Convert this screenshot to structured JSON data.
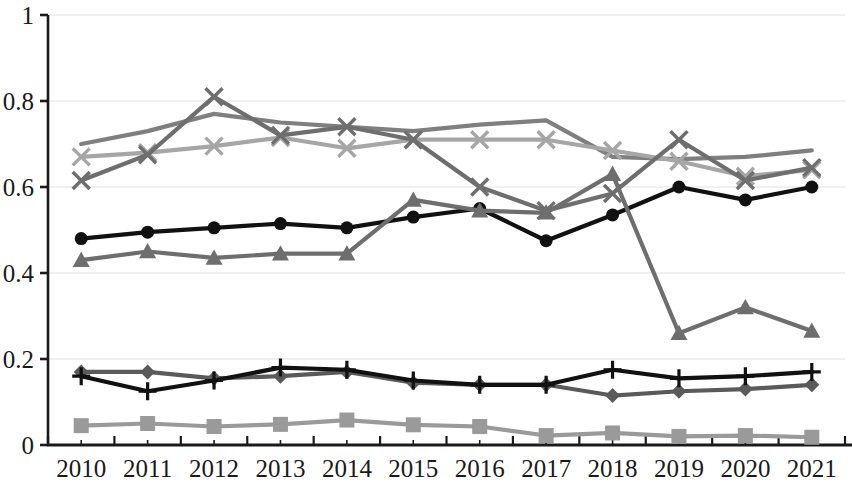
{
  "chart_data": {
    "type": "line",
    "title": "",
    "subtitle": "",
    "xlabel": "",
    "ylabel": "",
    "xlim": [
      2010,
      2021
    ],
    "ylim": [
      0,
      1
    ],
    "grid": true,
    "legend_position": "none",
    "categories": [
      "2010",
      "2011",
      "2012",
      "2013",
      "2014",
      "2015",
      "2016",
      "2017",
      "2018",
      "2019",
      "2020",
      "2021"
    ],
    "ytick_labels": [
      "0",
      "0.2",
      "0.4",
      "0.6",
      "0.8",
      "1"
    ],
    "ytick_values": [
      0,
      0.2,
      0.4,
      0.6,
      0.8,
      1
    ],
    "series": [
      {
        "name": "series-no-marker-upper",
        "marker": "none",
        "color": "#7f7f7f",
        "values": [
          0.7,
          0.73,
          0.77,
          0.75,
          0.74,
          0.73,
          0.745,
          0.755,
          0.67,
          0.665,
          0.67,
          0.685
        ]
      },
      {
        "name": "series-x-light",
        "marker": "x",
        "color": "#a6a6a6",
        "values": [
          0.67,
          0.68,
          0.695,
          0.715,
          0.69,
          0.71,
          0.71,
          0.71,
          0.685,
          0.66,
          0.625,
          0.64
        ]
      },
      {
        "name": "series-x-dark",
        "marker": "x",
        "color": "#6e6e6e",
        "values": [
          0.615,
          0.675,
          0.81,
          0.72,
          0.74,
          0.71,
          0.6,
          0.545,
          0.585,
          0.71,
          0.615,
          0.645
        ]
      },
      {
        "name": "series-circle-black",
        "marker": "circle",
        "color": "#111111",
        "values": [
          0.48,
          0.495,
          0.505,
          0.515,
          0.505,
          0.53,
          0.55,
          0.475,
          0.535,
          0.6,
          0.57,
          0.6
        ]
      },
      {
        "name": "series-triangle",
        "marker": "triangle",
        "color": "#6e6e6e",
        "values": [
          0.43,
          0.45,
          0.435,
          0.445,
          0.445,
          0.57,
          0.545,
          0.54,
          0.63,
          0.26,
          0.32,
          0.265
        ]
      },
      {
        "name": "series-diamond",
        "marker": "diamond",
        "color": "#5a5a5a",
        "values": [
          0.17,
          0.17,
          0.155,
          0.16,
          0.17,
          0.145,
          0.14,
          0.14,
          0.115,
          0.125,
          0.13,
          0.14
        ]
      },
      {
        "name": "series-plus-black",
        "marker": "plus",
        "color": "#111111",
        "values": [
          0.16,
          0.125,
          0.15,
          0.18,
          0.175,
          0.15,
          0.14,
          0.14,
          0.175,
          0.155,
          0.16,
          0.17
        ]
      },
      {
        "name": "series-square",
        "marker": "square",
        "color": "#9a9a9a",
        "values": [
          0.045,
          0.05,
          0.043,
          0.048,
          0.058,
          0.047,
          0.043,
          0.022,
          0.028,
          0.02,
          0.022,
          0.018
        ]
      }
    ]
  },
  "axes": {
    "y_axis_name": "y-axis",
    "x_axis_name": "x-axis"
  }
}
